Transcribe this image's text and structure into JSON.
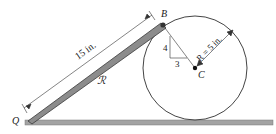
{
  "diagram": {
    "points": {
      "Q": "Q",
      "B": "B",
      "C": "C"
    },
    "labels": {
      "bar_length": "15 in.",
      "region": "ℛ",
      "slope_rise": "4",
      "slope_run": "3",
      "radius": "R = 5 in."
    },
    "colors": {
      "bar_fill": "#8c8c8c",
      "bar_edge": "#3a3a3a",
      "ground": "#9a9a9a",
      "line": "#333333"
    }
  }
}
